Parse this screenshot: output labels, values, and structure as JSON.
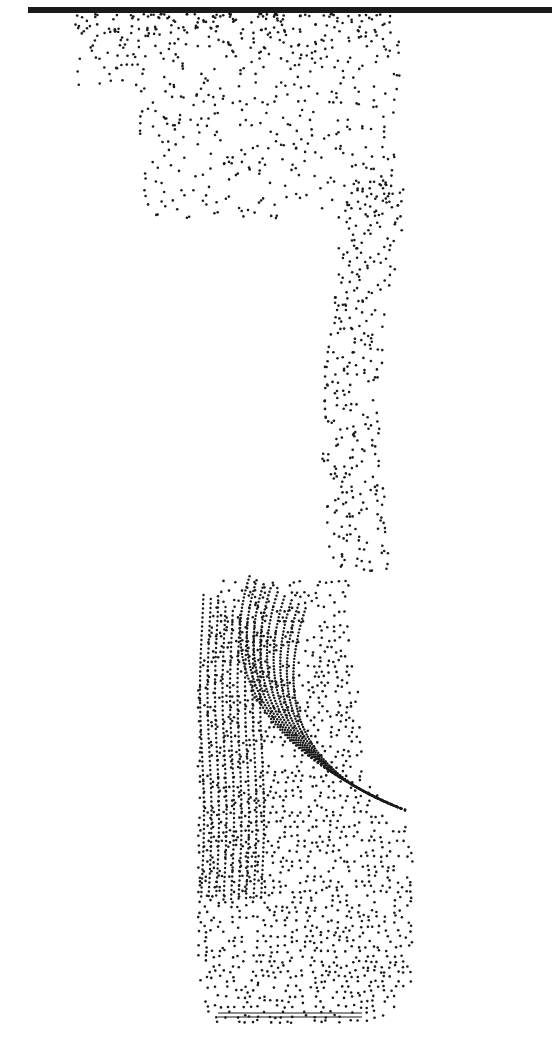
{
  "figure": {
    "background": "#ffffff",
    "dot_color": "#1a1a1a",
    "ceiling": {
      "x1": 28,
      "x2": 552,
      "y": 10,
      "thickness": 6
    },
    "source_bar": {
      "x1": 218,
      "x2": 362,
      "y": 1013
    },
    "plume": {
      "lower_body": {
        "left": 198,
        "right": 412,
        "top": 570,
        "bottom": 1022
      },
      "neck": {
        "x": 360,
        "top": 180,
        "bottom": 570,
        "width": 60
      },
      "upper_spread": {
        "left": 75,
        "right": 400,
        "top": 14,
        "bottom": 220
      }
    },
    "streamlines": {
      "count": 9,
      "origin": [
        405,
        810
      ],
      "apex_y": 575,
      "left_x": 210
    }
  }
}
